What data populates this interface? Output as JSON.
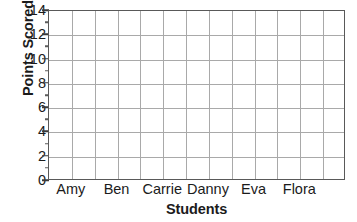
{
  "chart_data": {
    "type": "bar",
    "title": "",
    "xlabel": "Students",
    "ylabel": "Points Scored",
    "categories": [
      "Amy",
      "Ben",
      "Carrie",
      "Danny",
      "Eva",
      "Flora"
    ],
    "values": [
      0,
      0,
      0,
      0,
      0,
      0
    ],
    "ylim": [
      0,
      14
    ],
    "y_tick_step": 2,
    "y_ticks": [
      0,
      2,
      4,
      6,
      8,
      10,
      12,
      14
    ],
    "y_tick_labels": [
      "0",
      "2",
      "4",
      "6",
      "8",
      "10",
      "12",
      "14"
    ],
    "y_minor_ticks": [
      1,
      3,
      5,
      7,
      9,
      11,
      13
    ],
    "grid": true,
    "grid_columns": 13,
    "grid_rows": 7,
    "legend": "none",
    "note": "Empty grid — no bars plotted; blank graph for student data entry",
    "colors": {
      "axis": "#595959",
      "grid": "#a9a9a9",
      "text": "#1b1b1b",
      "background": "#ffffff"
    }
  }
}
